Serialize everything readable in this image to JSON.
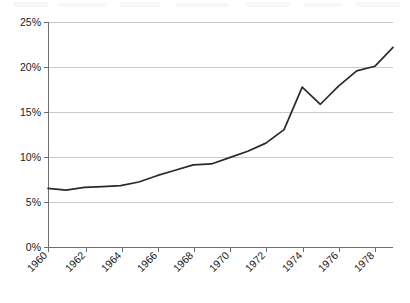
{
  "chart_data": {
    "type": "line",
    "title": "",
    "subtitle": "",
    "xlabel": "",
    "ylabel": "",
    "xlim": [
      1960,
      1979
    ],
    "ylim": [
      0,
      25
    ],
    "grid": true,
    "legend": false,
    "legend_position": "none",
    "y_tick_labels": [
      "0%",
      "5%",
      "10%",
      "15%",
      "20%",
      "25%"
    ],
    "y_tick_values": [
      0,
      5,
      10,
      15,
      20,
      25
    ],
    "x_tick_labels": [
      "1960",
      "1962",
      "1964",
      "1966",
      "1968",
      "1970",
      "1972",
      "1974",
      "1976",
      "1978"
    ],
    "x_tick_values": [
      1960,
      1962,
      1964,
      1966,
      1968,
      1970,
      1972,
      1974,
      1976,
      1978
    ],
    "x_label_rotation": 45,
    "line_color": "#2a2a2a",
    "grid_color": "#c9c9c9",
    "axis_color": "#6e6e6e",
    "background_color": "#ffffff",
    "x": [
      1960,
      1961,
      1962,
      1963,
      1964,
      1965,
      1966,
      1967,
      1968,
      1969,
      1970,
      1971,
      1972,
      1973,
      1974,
      1975,
      1976,
      1977,
      1978,
      1979
    ],
    "values": [
      6.6,
      6.4,
      6.7,
      6.8,
      6.9,
      7.3,
      8.0,
      8.6,
      9.2,
      9.3,
      10.0,
      10.7,
      11.6,
      13.1,
      17.8,
      15.9,
      17.9,
      19.6,
      20.1,
      22.2
    ],
    "series": [
      {
        "name": "",
        "values": [
          6.6,
          6.4,
          6.7,
          6.8,
          6.9,
          7.3,
          8.0,
          8.6,
          9.2,
          9.3,
          10.0,
          10.7,
          11.6,
          13.1,
          17.8,
          15.9,
          17.9,
          19.6,
          20.1,
          22.2
        ]
      }
    ],
    "annotations": []
  },
  "axes": {
    "y_ticks": [
      {
        "label": "0%",
        "value": 0
      },
      {
        "label": "5%",
        "value": 5
      },
      {
        "label": "10%",
        "value": 10
      },
      {
        "label": "15%",
        "value": 15
      },
      {
        "label": "20%",
        "value": 20
      },
      {
        "label": "25%",
        "value": 25
      }
    ],
    "x_ticks": [
      {
        "label": "1960",
        "value": 1960
      },
      {
        "label": "1962",
        "value": 1962
      },
      {
        "label": "1964",
        "value": 1964
      },
      {
        "label": "1966",
        "value": 1966
      },
      {
        "label": "1968",
        "value": 1968
      },
      {
        "label": "1970",
        "value": 1970
      },
      {
        "label": "1972",
        "value": 1972
      },
      {
        "label": "1974",
        "value": 1974
      },
      {
        "label": "1976",
        "value": 1976
      },
      {
        "label": "1978",
        "value": 1978
      }
    ]
  }
}
